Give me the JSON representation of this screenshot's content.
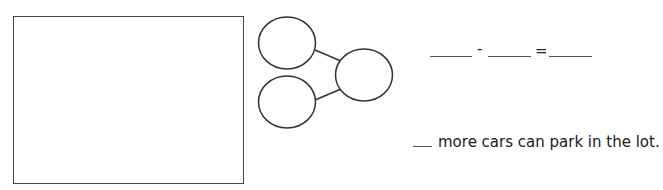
{
  "worksheet": {
    "drawing_area": {
      "label": ""
    },
    "number_bond": {
      "parts": [
        "",
        ""
      ],
      "whole": ""
    },
    "equation": {
      "blank1": "",
      "operator": "-",
      "blank2": "",
      "equals": "=",
      "result": ""
    },
    "answer_sentence": {
      "blank": "",
      "text": "more cars can park in the lot."
    }
  }
}
